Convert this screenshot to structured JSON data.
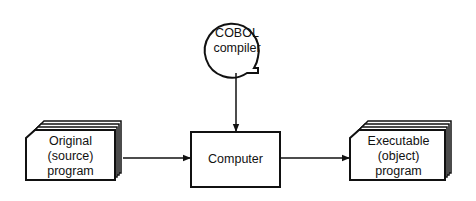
{
  "diagram": {
    "nodes": {
      "compiler": {
        "lines": [
          "COBOL",
          "compiler"
        ],
        "shape": "magnetic-tape"
      },
      "source": {
        "lines": [
          "Original",
          "(source)",
          "program"
        ],
        "shape": "card-deck"
      },
      "computer": {
        "label": "Computer",
        "shape": "rectangle"
      },
      "object": {
        "lines": [
          "Executable",
          "(object)",
          "program"
        ],
        "shape": "card-deck"
      }
    },
    "edges": [
      {
        "from": "compiler",
        "to": "computer"
      },
      {
        "from": "source",
        "to": "computer"
      },
      {
        "from": "computer",
        "to": "object"
      }
    ],
    "colors": {
      "stroke": "#111111",
      "background": "#ffffff"
    }
  }
}
